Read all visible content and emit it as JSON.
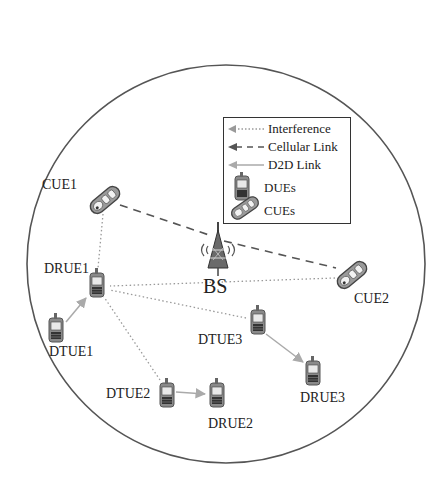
{
  "diagram": {
    "type": "network-topology",
    "cell": {
      "cx": 226,
      "cy": 264,
      "r": 199
    },
    "colors": {
      "circle": "#555555",
      "interference": "#9a9a9a",
      "cellular": "#555555",
      "d2d": "#aaaaaa",
      "device_body": "#777777",
      "text": "#222222"
    },
    "base_station": {
      "label": "BS",
      "x": 218,
      "y": 250
    },
    "nodes": [
      {
        "id": "CUE1",
        "label": "CUE1",
        "kind": "cue",
        "x": 105,
        "y": 200
      },
      {
        "id": "CUE2",
        "label": "CUE2",
        "kind": "cue",
        "x": 352,
        "y": 275
      },
      {
        "id": "DRUE1",
        "label": "DRUE1",
        "kind": "due",
        "x": 97,
        "y": 285
      },
      {
        "id": "DTUE1",
        "label": "DTUE1",
        "kind": "due",
        "x": 56,
        "y": 330
      },
      {
        "id": "DTUE2",
        "label": "DTUE2",
        "kind": "due",
        "x": 167,
        "y": 395
      },
      {
        "id": "DRUE2",
        "label": "DRUE2",
        "kind": "due",
        "x": 217,
        "y": 395
      },
      {
        "id": "DTUE3",
        "label": "DTUE3",
        "kind": "due",
        "x": 258,
        "y": 322
      },
      {
        "id": "DRUE3",
        "label": "DRUE3",
        "kind": "due",
        "x": 313,
        "y": 373
      }
    ],
    "links": [
      {
        "from": "CUE1",
        "to": "CUE2",
        "type": "cellular",
        "via": "BS"
      },
      {
        "from": "DTUE1",
        "to": "DRUE1",
        "type": "d2d"
      },
      {
        "from": "DTUE2",
        "to": "DRUE2",
        "type": "d2d"
      },
      {
        "from": "DTUE3",
        "to": "DRUE3",
        "type": "d2d"
      },
      {
        "from": "CUE1",
        "to": "DRUE1",
        "type": "interference"
      },
      {
        "from": "DTUE2",
        "to": "DRUE1",
        "type": "interference"
      },
      {
        "from": "DTUE3",
        "to": "DRUE1",
        "type": "interference"
      },
      {
        "from": "CUE2",
        "to": "DRUE1",
        "type": "interference"
      }
    ],
    "legend": {
      "items": [
        {
          "label": "Interference",
          "symbol": "dotted-arrow"
        },
        {
          "label": "Cellular Link",
          "symbol": "dashed-arrow"
        },
        {
          "label": "D2D Link",
          "symbol": "solid-arrow"
        },
        {
          "label": "DUEs",
          "symbol": "due-phone-icon"
        },
        {
          "label": "CUEs",
          "symbol": "cue-phone-icon"
        }
      ]
    }
  },
  "labels": {
    "CUE1": "CUE1",
    "CUE2": "CUE2",
    "DRUE1": "DRUE1",
    "DTUE1": "DTUE1",
    "DTUE2": "DTUE2",
    "DRUE2": "DRUE2",
    "DTUE3": "DTUE3",
    "DRUE3": "DRUE3",
    "BS": "BS"
  },
  "legend_labels": {
    "interference": "Interference",
    "cellular": "Cellular Link",
    "d2d": "D2D Link",
    "dues": "DUEs",
    "cues": "CUEs"
  }
}
